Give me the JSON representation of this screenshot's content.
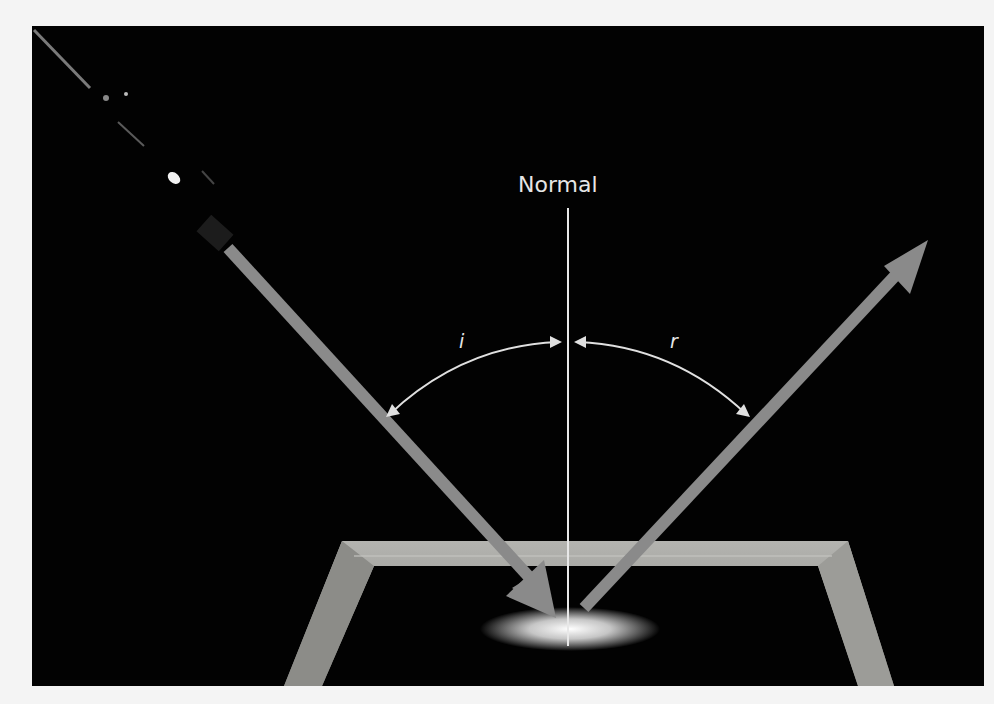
{
  "figure": {
    "normal_label": "Normal",
    "incidence_angle_label": "i",
    "reflection_angle_label": "r",
    "colors": {
      "background": "#020202",
      "page": "#f4f4f4",
      "ray": "#8a8a8a",
      "normal_line": "#e8e8e8",
      "arc": "#e0e0e0",
      "frame": "#9a9a96"
    }
  }
}
